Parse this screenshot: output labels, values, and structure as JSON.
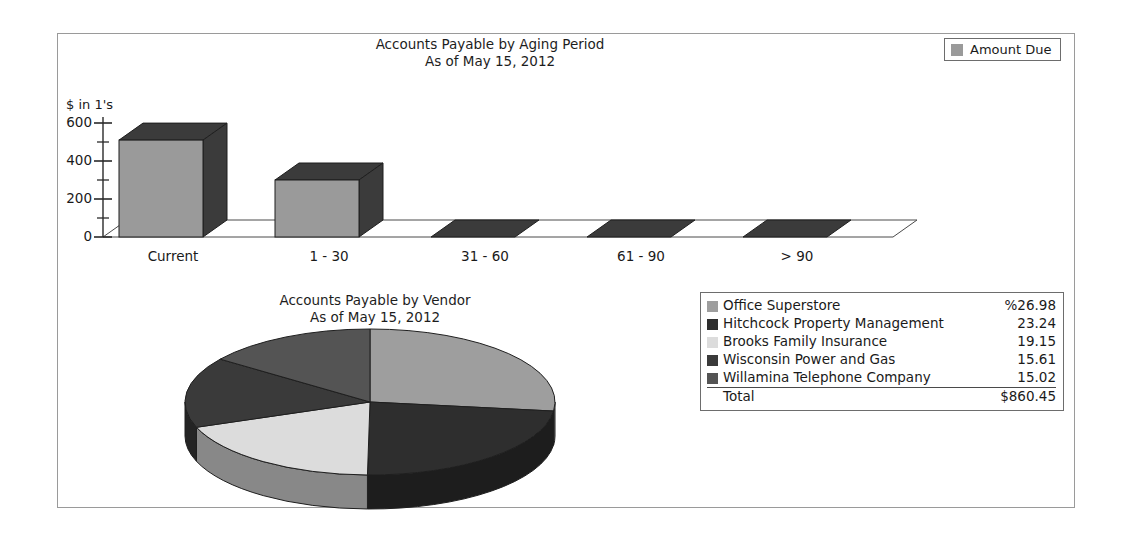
{
  "bar_legend": {
    "label": "Amount Due",
    "swatch_color": "#9a9a9a"
  },
  "pie_legend": {
    "total_label": "Total",
    "total_value": "$860.45"
  },
  "chart_data": [
    {
      "type": "bar",
      "title": "Accounts Payable by Aging Period",
      "subtitle": "As of May 15, 2012",
      "xlabel": "",
      "ylabel": "$ in 1's",
      "ylim": [
        0,
        600
      ],
      "yticks": [
        0,
        200,
        400,
        600
      ],
      "ytick_labels": [
        "0",
        "200",
        "400",
        "600"
      ],
      "minor_tick_step": 100,
      "grid": false,
      "legend_position": "top-right",
      "categories": [
        "Current",
        "1 - 30",
        "31 - 60",
        "61 - 90",
        "> 90"
      ],
      "series": [
        {
          "name": "Amount Due",
          "values": [
            510,
            300,
            0,
            0,
            0
          ]
        }
      ],
      "bar_face_color": "#9a9a9a",
      "bar_shade_color": "#3b3b3b"
    },
    {
      "type": "pie",
      "title": "Accounts Payable by Vendor",
      "subtitle": "As of May 15, 2012",
      "legend_position": "right",
      "value_suffix": "%",
      "total": "$860.45",
      "slices": [
        {
          "label": "Office Superstore",
          "value": 26.98,
          "display": "%26.98",
          "color": "#9e9e9e"
        },
        {
          "label": "Hitchcock Property Management",
          "value": 23.24,
          "display": "23.24",
          "color": "#2e2e2e"
        },
        {
          "label": "Brooks Family Insurance",
          "value": 19.15,
          "display": "19.15",
          "color": "#dcdcdc"
        },
        {
          "label": "Wisconsin Power and Gas",
          "value": 15.61,
          "display": "15.61",
          "color": "#3a3a3a"
        },
        {
          "label": "Willamina Telephone Company",
          "value": 15.02,
          "display": "15.02",
          "color": "#545454"
        }
      ]
    }
  ]
}
